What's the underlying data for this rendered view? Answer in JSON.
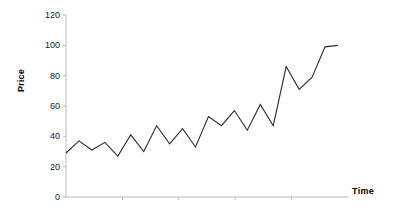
{
  "chart_data": {
    "type": "line",
    "title": "",
    "xlabel": "Time",
    "ylabel": "Price",
    "grid": false,
    "legend": false,
    "ylim": [
      0,
      120
    ],
    "yticks": [
      0,
      20,
      40,
      60,
      80,
      100,
      120
    ],
    "ytick_labels": [
      "0",
      "20",
      "40",
      "60",
      "80",
      "100",
      "120"
    ],
    "xticks": [],
    "xtick_labels": [],
    "x": [
      1,
      2,
      3,
      4,
      5,
      6,
      7,
      8,
      9,
      10,
      11,
      12,
      13,
      14,
      15,
      16,
      17,
      18,
      19,
      20,
      21,
      22
    ],
    "series": [
      {
        "name": "Price",
        "color": "#2b2b2b",
        "values": [
          29,
          37,
          31,
          36,
          27,
          41,
          30,
          47,
          35,
          45,
          33,
          53,
          47,
          57,
          44,
          61,
          47,
          86,
          71,
          79,
          99,
          100
        ]
      }
    ]
  },
  "axis": {
    "y_title": "Price",
    "x_title": "Time",
    "y_max_label": "120",
    "y_min_label": "0"
  }
}
